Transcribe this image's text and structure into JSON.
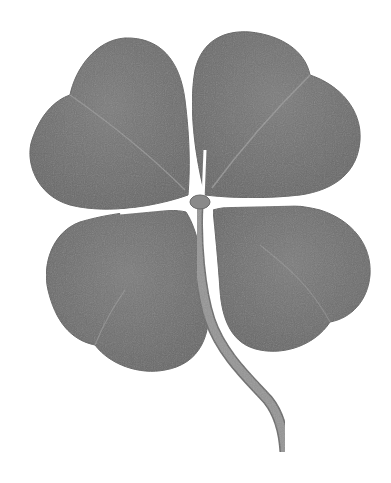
{
  "image": {
    "subject": "four-leaf clover",
    "style": "grayscale photograph",
    "background": "#ffffff",
    "colors": {
      "leaf": "#767676",
      "leaf_dark": "#5f5f5f",
      "vein": "#9a9a9a",
      "stem": "#8f8f8f",
      "stem_edge": "#6a6a6a"
    },
    "leaves": [
      {
        "name": "top-left"
      },
      {
        "name": "top-right"
      },
      {
        "name": "bottom-left"
      },
      {
        "name": "bottom-right"
      }
    ]
  }
}
